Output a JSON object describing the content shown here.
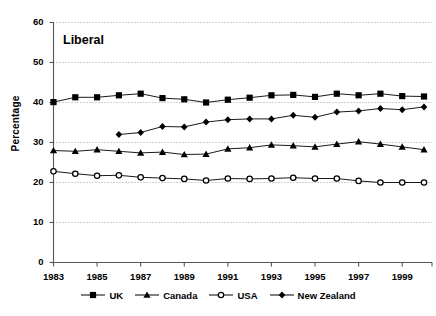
{
  "chart_data": {
    "type": "line",
    "title": "Liberal",
    "xlabel": "",
    "ylabel": "Percentage",
    "ylim": [
      0,
      60
    ],
    "ytick_step": 10,
    "yticks": [
      "0",
      "10",
      "20",
      "30",
      "40",
      "50",
      "60"
    ],
    "xlim": [
      1983,
      2000
    ],
    "xticks": [
      "1983",
      "1985",
      "1987",
      "1989",
      "1991",
      "1993",
      "1995",
      "1997",
      "1999"
    ],
    "xtick_years": [
      1983,
      1985,
      1987,
      1989,
      1991,
      1993,
      1995,
      1997,
      1999
    ],
    "x": [
      1983,
      1984,
      1985,
      1986,
      1987,
      1988,
      1989,
      1990,
      1991,
      1992,
      1993,
      1994,
      1995,
      1996,
      1997,
      1998,
      1999,
      2000
    ],
    "grid": "horizontal-dotted",
    "legend_position": "bottom",
    "series": [
      {
        "name": "UK",
        "marker": "filled-square",
        "color": "#000000",
        "values": [
          40.1,
          41.3,
          41.3,
          41.8,
          42.2,
          41.1,
          40.8,
          40.0,
          40.7,
          41.2,
          41.8,
          41.9,
          41.4,
          42.2,
          41.8,
          42.2,
          41.6,
          41.5
        ]
      },
      {
        "name": "Canada",
        "marker": "filled-triangle",
        "color": "#000000",
        "values": [
          28.0,
          27.8,
          28.2,
          27.8,
          27.4,
          27.6,
          27.0,
          27.1,
          28.4,
          28.7,
          29.4,
          29.2,
          28.9,
          29.6,
          30.2,
          29.6,
          28.9,
          28.2
        ]
      },
      {
        "name": "USA",
        "marker": "open-circle",
        "color": "#000000",
        "values": [
          22.8,
          22.2,
          21.7,
          21.8,
          21.3,
          21.1,
          20.9,
          20.5,
          21.0,
          20.9,
          21.0,
          21.2,
          21.0,
          21.0,
          20.4,
          20.0,
          20.0,
          20.0
        ]
      },
      {
        "name": "New Zealand",
        "marker": "filled-diamond",
        "color": "#000000",
        "values": [
          null,
          null,
          null,
          32.0,
          32.5,
          34.0,
          33.9,
          35.1,
          35.7,
          35.9,
          35.9,
          36.8,
          36.3,
          37.6,
          37.9,
          38.5,
          38.2,
          38.9
        ]
      }
    ]
  },
  "legend": {
    "items": [
      {
        "label": "UK",
        "marker": "filled-square"
      },
      {
        "label": "Canada",
        "marker": "filled-triangle"
      },
      {
        "label": "USA",
        "marker": "open-circle"
      },
      {
        "label": "New Zealand",
        "marker": "filled-diamond"
      }
    ]
  }
}
